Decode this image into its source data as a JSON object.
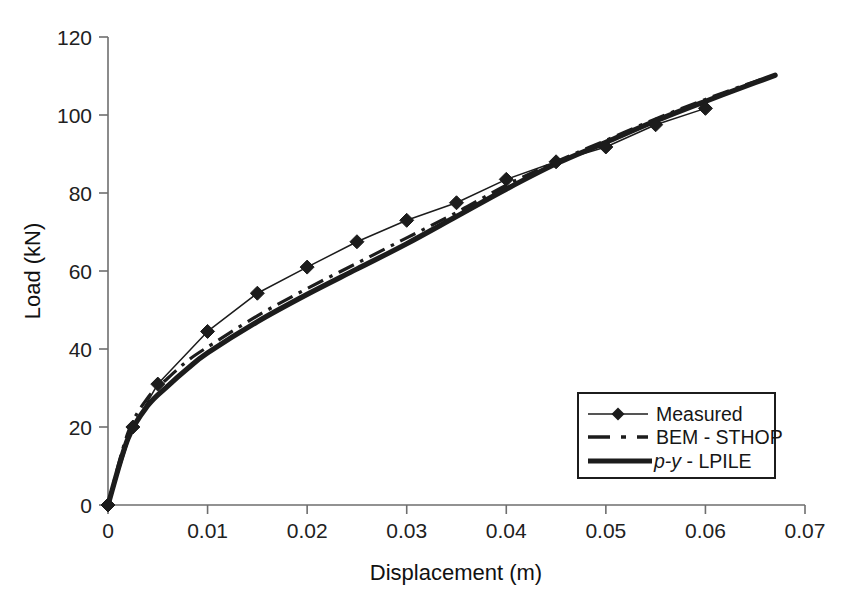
{
  "chart_data": {
    "type": "line",
    "title": "",
    "xlabel": "Displacement (m)",
    "ylabel": "Load (kN)",
    "xlim": [
      0,
      0.07
    ],
    "ylim": [
      0,
      120
    ],
    "xticks": [
      "0",
      "0.01",
      "0.02",
      "0.03",
      "0.04",
      "0.05",
      "0.06",
      "0.07"
    ],
    "xtick_values": [
      0,
      0.01,
      0.02,
      0.03,
      0.04,
      0.05,
      0.06,
      0.07
    ],
    "yticks": [
      "0",
      "20",
      "40",
      "60",
      "80",
      "100",
      "120"
    ],
    "ytick_values": [
      0,
      20,
      40,
      60,
      80,
      100,
      120
    ],
    "grid": false,
    "legend_position": "lower-right",
    "series": [
      {
        "name": "Measured",
        "style": "thin-line-with-diamond-markers",
        "color": "#1c1c1c",
        "x": [
          0,
          0.0025,
          0.005,
          0.01,
          0.015,
          0.02,
          0.025,
          0.03,
          0.035,
          0.04,
          0.045,
          0.05,
          0.055,
          0.06
        ],
        "y": [
          0,
          20,
          31,
          44.5,
          54.3,
          61,
          67.5,
          73,
          77.5,
          83.5,
          88,
          91.8,
          97.5,
          101.7
        ]
      },
      {
        "name": "BEM - STHOP",
        "style": "dash-dot-line",
        "color": "#1c1c1c",
        "x": [
          0,
          0.002,
          0.004,
          0.006,
          0.008,
          0.01,
          0.015,
          0.02,
          0.025,
          0.03,
          0.035,
          0.04,
          0.045,
          0.05,
          0.055,
          0.06,
          0.065,
          0.067
        ],
        "y": [
          0,
          18.5,
          27.5,
          32.5,
          37.0,
          40.5,
          48.5,
          55.5,
          62.0,
          68.5,
          75.0,
          82.0,
          88.0,
          93.5,
          99.0,
          104.0,
          108.6,
          110.2
        ]
      },
      {
        "name": "p-y - LPILE",
        "style": "thick-solid-line",
        "color": "#1c1c1c",
        "x": [
          0,
          0.002,
          0.004,
          0.006,
          0.008,
          0.01,
          0.015,
          0.02,
          0.025,
          0.03,
          0.035,
          0.04,
          0.045,
          0.05,
          0.055,
          0.06,
          0.065,
          0.067
        ],
        "y": [
          0,
          17.0,
          25.5,
          30.5,
          35.0,
          39.0,
          47.0,
          54.0,
          60.5,
          67.0,
          74.0,
          81.0,
          87.5,
          93.0,
          98.5,
          103.5,
          108.3,
          110.2
        ]
      }
    ]
  },
  "legend": {
    "entries": [
      {
        "label": "Measured",
        "marker": "diamond",
        "line": "thin"
      },
      {
        "label": "BEM - STHOP",
        "marker": "none",
        "line": "dash-dot"
      },
      {
        "label": "p-y - LPILE",
        "marker": "none",
        "line": "thick",
        "italic_prefix": "p-y",
        "rest": " - LPILE"
      }
    ]
  },
  "colors": {
    "foreground": "#1c1c1c",
    "axis": "#6e6e6e",
    "background": "#ffffff"
  }
}
